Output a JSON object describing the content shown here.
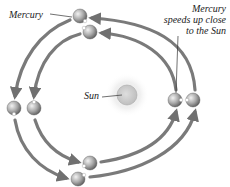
{
  "diagram": {
    "labels": {
      "mercury": "Mercury",
      "speed_line1": "Mercury",
      "speed_line2": "speeds up close",
      "speed_line3": "to the Sun",
      "sun": "Sun"
    },
    "nodes": [
      {
        "id": "sun",
        "label": "Sun",
        "x": 127,
        "y": 95
      },
      {
        "id": "mercury-top-outer",
        "x": 80,
        "y": 16
      },
      {
        "id": "mercury-top-inner",
        "x": 90,
        "y": 32
      },
      {
        "id": "mercury-left-outer",
        "x": 14,
        "y": 108
      },
      {
        "id": "mercury-left-inner",
        "x": 34,
        "y": 108
      },
      {
        "id": "mercury-bottom-inner",
        "x": 90,
        "y": 165
      },
      {
        "id": "mercury-bottom-outer",
        "x": 78,
        "y": 180
      },
      {
        "id": "mercury-right-inner",
        "x": 175,
        "y": 100
      },
      {
        "id": "mercury-right-outer",
        "x": 193,
        "y": 100
      }
    ],
    "edges": [
      {
        "from": "mercury-right-outer",
        "to": "mercury-top-outer",
        "type": "orbit-arrow"
      },
      {
        "from": "mercury-right-inner",
        "to": "mercury-top-inner",
        "type": "orbit-arrow"
      },
      {
        "from": "mercury-top-outer",
        "to": "mercury-left-outer",
        "type": "orbit-arrow"
      },
      {
        "from": "mercury-top-inner",
        "to": "mercury-left-inner",
        "type": "orbit-arrow"
      },
      {
        "from": "mercury-left-outer",
        "to": "mercury-bottom-outer",
        "type": "orbit-arrow"
      },
      {
        "from": "mercury-left-inner",
        "to": "mercury-bottom-inner",
        "type": "orbit-arrow"
      },
      {
        "from": "mercury-bottom-inner",
        "to": "mercury-right-inner",
        "type": "orbit-arrow"
      },
      {
        "from": "mercury-bottom-outer",
        "to": "mercury-right-outer",
        "type": "orbit-arrow"
      }
    ],
    "colors": {
      "arrow": "#7a7a7a",
      "planet": "#a8a8a8",
      "sun": "#d0d0d0",
      "sun_glow": "#e6e6e6",
      "text": "#222222"
    }
  }
}
